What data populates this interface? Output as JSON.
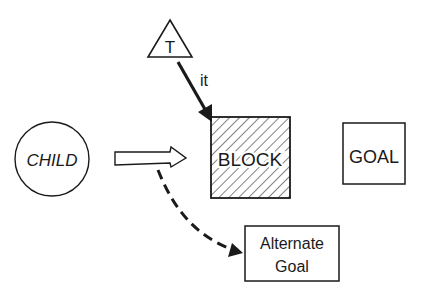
{
  "diagram": {
    "nodes": {
      "teacher": {
        "label": "T",
        "shape": "triangle"
      },
      "child": {
        "label": "CHILD",
        "shape": "circle"
      },
      "block": {
        "label": "BLOCK",
        "shape": "hatched-square"
      },
      "goal": {
        "label": "GOAL",
        "shape": "square"
      },
      "alternate_goal": {
        "label_line1": "Alternate",
        "label_line2": "Goal",
        "shape": "rectangle"
      }
    },
    "edges": {
      "teacher_to_block": {
        "label": "it",
        "style": "solid-arrow"
      },
      "child_to_block": {
        "label": "",
        "style": "hollow-arrow"
      },
      "child_to_alternate": {
        "label": "",
        "style": "dashed-curved-arrow"
      }
    },
    "colors": {
      "ink": "#1a1a1a",
      "background": "#ffffff"
    }
  }
}
